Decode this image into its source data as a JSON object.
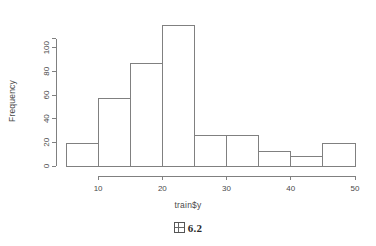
{
  "chart_data": {
    "type": "bar",
    "title": "",
    "subtitle": "",
    "xlabel": "train$y",
    "ylabel": "Frequency",
    "categories": [
      "5-10",
      "10-15",
      "15-20",
      "20-25",
      "25-30",
      "30-35",
      "35-40",
      "40-45",
      "45-50"
    ],
    "bin_edges": [
      5,
      10,
      15,
      20,
      25,
      30,
      35,
      40,
      45,
      50
    ],
    "values": [
      19,
      57,
      87,
      119,
      26,
      26,
      12,
      8,
      19
    ],
    "xlim": [
      5,
      50
    ],
    "ylim": [
      0,
      120
    ],
    "xticks": [
      10,
      20,
      30,
      40,
      50
    ],
    "xtick_labels": [
      "10",
      "20",
      "30",
      "40",
      "50"
    ],
    "yticks": [
      0,
      20,
      40,
      60,
      80,
      100
    ],
    "ytick_labels": [
      "0",
      "20",
      "40",
      "60",
      "80",
      "100"
    ],
    "grid": false,
    "legend": false,
    "legend_position": "none",
    "bar_fill": "#ffffff",
    "bar_edge_color": "#808080",
    "axis_color": "#808080",
    "text_color": "#4a4a4a"
  },
  "caption": {
    "icon_glyph": "missing-glyph-box",
    "number": "6.2"
  }
}
